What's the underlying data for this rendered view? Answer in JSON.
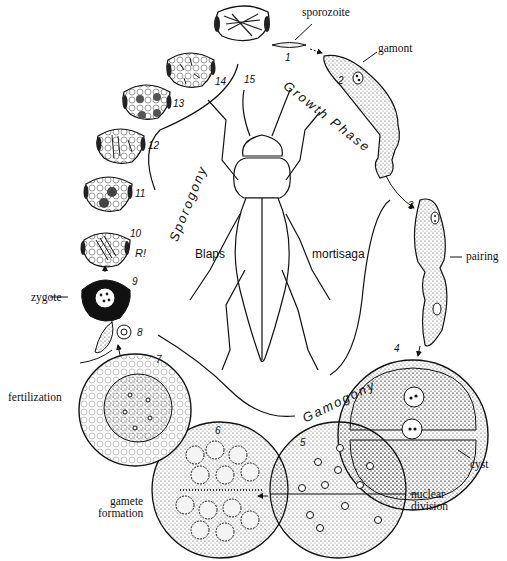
{
  "diagram": {
    "organism": {
      "genus": "Blaps",
      "species": "mortisaga"
    },
    "phases": {
      "growth": "Growth Phase",
      "sporogony": "Sporogony",
      "gamogony": "Gamogony"
    },
    "labels": {
      "sporozoite": "sporozoite",
      "gamont": "gamont",
      "pairing": "pairing",
      "cyst": "cyst",
      "nuclear_division": [
        "nuclear",
        "division"
      ],
      "gamete_formation": [
        "gamete",
        "formation"
      ],
      "fertilization": "fertilization",
      "zygote": "zygote",
      "reduction": "R!"
    },
    "stages": [
      "1",
      "2",
      "3",
      "4",
      "5",
      "6",
      "7",
      "8",
      "9",
      "10",
      "11",
      "12",
      "13",
      "14",
      "15"
    ]
  }
}
